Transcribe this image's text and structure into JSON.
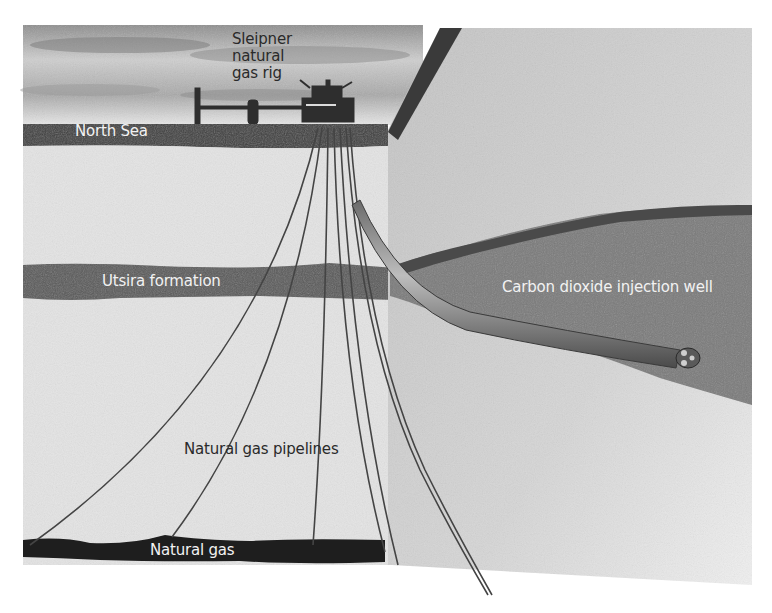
{
  "diagram": {
    "labels": {
      "rig": [
        "Sleipner",
        "natural",
        "gas rig"
      ],
      "north_sea": "North Sea",
      "utsira": "Utsira formation",
      "co2_well": "Carbon dioxide injection well",
      "pipelines": "Natural gas pipelines",
      "natural_gas": "Natural gas"
    },
    "colors": {
      "sky": "#d9d9d9",
      "sea": "#3c3c3c",
      "rock_light": "#e6e6e6",
      "rock_block": "#c9c9c9",
      "formation": "#5a5a5a",
      "gas_layer": "#1e1e1e",
      "pipe": "#444444"
    }
  }
}
